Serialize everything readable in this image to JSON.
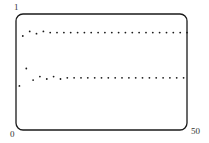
{
  "chart_data": {
    "type": "scatter",
    "title": "",
    "xlabel": "",
    "ylabel": "",
    "xlim": [
      0,
      50
    ],
    "ylim": [
      0,
      1
    ],
    "grid": false,
    "legend": null,
    "tick_labels": {
      "x_min": "0",
      "x_max": "50",
      "y_max": "1"
    },
    "series": [
      {
        "name": "iterates",
        "x": [
          1,
          2,
          3,
          4,
          5,
          6,
          7,
          8,
          9,
          10,
          11,
          12,
          13,
          14,
          15,
          16,
          17,
          18,
          19,
          20,
          21,
          22,
          23,
          24,
          25,
          26,
          27,
          28,
          29,
          30,
          31,
          32,
          33,
          34,
          35,
          36,
          37,
          38,
          39,
          40,
          41,
          42,
          43,
          44,
          45,
          46,
          47,
          48,
          49,
          50
        ],
        "y": [
          0.38,
          0.81,
          0.53,
          0.85,
          0.43,
          0.83,
          0.46,
          0.85,
          0.44,
          0.84,
          0.46,
          0.84,
          0.44,
          0.84,
          0.45,
          0.84,
          0.45,
          0.84,
          0.45,
          0.84,
          0.45,
          0.84,
          0.45,
          0.84,
          0.45,
          0.84,
          0.45,
          0.84,
          0.45,
          0.84,
          0.45,
          0.84,
          0.45,
          0.84,
          0.45,
          0.84,
          0.45,
          0.84,
          0.45,
          0.84,
          0.45,
          0.84,
          0.45,
          0.84,
          0.45,
          0.84,
          0.45,
          0.84,
          0.45,
          0.84
        ]
      }
    ]
  },
  "labels": {
    "y_top": "1",
    "x_origin": "0",
    "x_end": "50"
  },
  "colors": {
    "dot": "#1a1a1a",
    "frame": "#1a1a1a",
    "text": "#333333"
  }
}
